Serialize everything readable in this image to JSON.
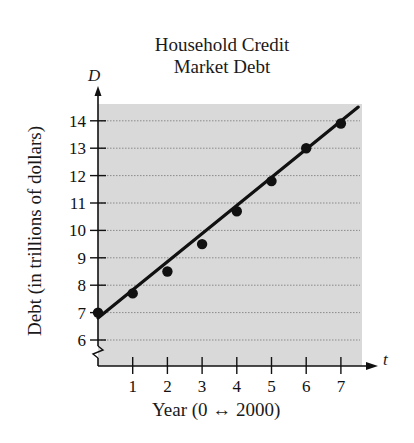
{
  "chart_data": {
    "type": "scatter",
    "title_lines": [
      "Household Credit",
      "Market Debt"
    ],
    "xlabel": "Year (0 ↔ 2000)",
    "ylabel": "Debt (in trillions of dollars)",
    "x_axis_variable": "t",
    "y_axis_variable": "D",
    "x_ticks": [
      1,
      2,
      3,
      4,
      5,
      6,
      7
    ],
    "y_ticks": [
      6,
      7,
      8,
      9,
      10,
      11,
      12,
      13,
      14
    ],
    "xlim": [
      0,
      7.5
    ],
    "ylim": [
      5.3,
      14.6
    ],
    "y_axis_break": true,
    "grid": {
      "horizontal": true,
      "vertical": false,
      "style": "dotted"
    },
    "background": "#d9d9d9",
    "legend": null,
    "series": [
      {
        "name": "Data points",
        "kind": "scatter",
        "x": [
          0,
          1,
          2,
          3,
          4,
          5,
          6,
          7
        ],
        "y": [
          7.0,
          7.7,
          8.5,
          9.5,
          10.7,
          11.8,
          13.0,
          13.9
        ]
      },
      {
        "name": "Linear model",
        "kind": "line",
        "x": [
          0,
          7.5
        ],
        "y": [
          6.8,
          14.5
        ]
      }
    ]
  },
  "labels": {
    "title_line1": "Household Credit",
    "title_line2": "Market Debt",
    "ylabel": "Debt (in trillions of dollars)",
    "xlabel": "Year (0 ↔ 2000)",
    "y_var": "D",
    "x_var": "t"
  },
  "colors": {
    "plot_background": "#d9d9d9",
    "ink": "#111111",
    "grid": "#8a8a8a"
  }
}
